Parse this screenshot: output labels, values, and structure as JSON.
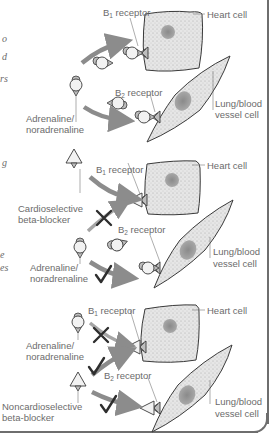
{
  "figure": {
    "type": "diagram",
    "left_margin_fragments": [
      {
        "text": "o",
        "y": 38
      },
      {
        "text": "d",
        "y": 56
      },
      {
        "text": "rs",
        "y": 78
      },
      {
        "text": "g",
        "y": 162
      },
      {
        "text": "e",
        "y": 255
      },
      {
        "text": "es",
        "y": 268
      }
    ],
    "colors": {
      "cell_fill": "#e4e4e4",
      "nucleus": "#9a9a9a",
      "arrow": "#8c8c8c",
      "outline": "#3a3a3a",
      "label": "#6b6b6b",
      "frame": "#6e6e6e"
    },
    "panels": [
      {
        "id": "panel-1",
        "labels": {
          "b1": "B",
          "b1_sub": "1",
          "b1_suffix": " receptor",
          "b2": "B",
          "b2_sub": "2",
          "b2_suffix": " receptor",
          "heart": "Heart cell",
          "lung_line1": "Lung/blood",
          "lung_line2": "vessel cell",
          "agonist_line1": "Adrenaline/",
          "agonist_line2": "noradrenaline"
        }
      },
      {
        "id": "panel-2",
        "labels": {
          "b1": "B",
          "b1_sub": "1",
          "b1_suffix": " receptor",
          "b2": "B",
          "b2_sub": "2",
          "b2_suffix": " receptor",
          "heart": "Heart cell",
          "lung_line1": "Lung/blood",
          "lung_line2": "vessel cell",
          "blocker_line1": "Cardioselective",
          "blocker_line2": "beta-blocker",
          "agonist_line1": "Adrenaline/",
          "agonist_line2": "noradrenaline"
        },
        "marks": {
          "b1_agonist": "cross",
          "b2_agonist": "check"
        }
      },
      {
        "id": "panel-3",
        "labels": {
          "b1": "B",
          "b1_sub": "1",
          "b1_suffix": " receptor",
          "b2": "B",
          "b2_sub": "2",
          "b2_suffix": " receptor",
          "heart": "Heart cell",
          "lung_line1": "Lung/blood",
          "lung_line2": "vessel cell",
          "agonist_line1": "Adrenaline/",
          "agonist_line2": "noradrenaline",
          "blocker_line1": "Noncardioselective",
          "blocker_line2": "beta-blocker"
        },
        "marks": {
          "b1_agonist": "cross",
          "b1_blocker": "check",
          "b2_blocker": "check"
        }
      }
    ]
  }
}
